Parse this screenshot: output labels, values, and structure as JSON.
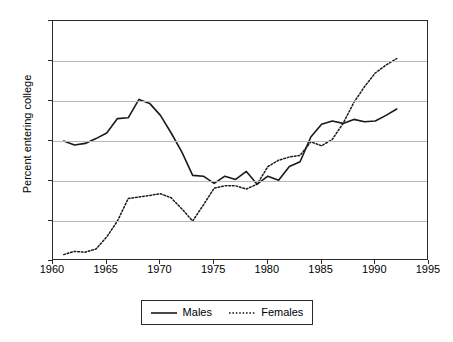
{
  "chart_data": {
    "type": "line",
    "title": "",
    "xlabel": "",
    "ylabel": "Percent entering college",
    "xlim": [
      1960,
      1995
    ],
    "ylim": [
      40,
      70
    ],
    "grid": true,
    "legend_position": "bottom",
    "x_ticks": [
      1960,
      1965,
      1970,
      1975,
      1980,
      1985,
      1990,
      1995
    ],
    "y_ticks": [
      40,
      45,
      50,
      55,
      60,
      65,
      70
    ],
    "x": [
      1961,
      1962,
      1963,
      1964,
      1965,
      1966,
      1967,
      1968,
      1969,
      1970,
      1971,
      1972,
      1973,
      1974,
      1975,
      1976,
      1977,
      1978,
      1979,
      1980,
      1981,
      1982,
      1983,
      1984,
      1985,
      1986,
      1987,
      1988,
      1989,
      1990,
      1991,
      1992
    ],
    "series": [
      {
        "name": "Males",
        "style": "solid",
        "color": "#1a1a1a",
        "values": [
          55.0,
          54.5,
          54.7,
          55.3,
          56.0,
          57.8,
          57.9,
          60.2,
          59.7,
          58.2,
          56.0,
          53.6,
          50.7,
          50.6,
          49.7,
          50.6,
          50.2,
          51.2,
          49.6,
          50.6,
          50.1,
          51.8,
          52.4,
          55.5,
          57.1,
          57.5,
          57.2,
          57.7,
          57.4,
          57.5,
          58.2,
          59.0
        ]
      },
      {
        "name": "Females",
        "style": "dotted",
        "color": "#1a1a1a",
        "values": [
          40.8,
          41.2,
          41.1,
          41.5,
          43.0,
          45.0,
          47.8,
          48.0,
          48.2,
          48.4,
          47.9,
          46.5,
          45.0,
          47.0,
          49.1,
          49.4,
          49.4,
          49.0,
          49.6,
          51.8,
          52.6,
          53.0,
          53.2,
          54.9,
          54.4,
          55.2,
          57.2,
          59.8,
          61.8,
          63.5,
          64.5,
          65.3
        ]
      }
    ]
  },
  "axes": {
    "y_title": "Percent entering college",
    "y_tick_labels": [
      "70",
      "65",
      "60",
      "55",
      "50",
      "45",
      "40"
    ],
    "x_tick_labels": [
      "1960",
      "1965",
      "1970",
      "1975",
      "1980",
      "1985",
      "1990",
      "1995"
    ]
  },
  "legend": {
    "entries": [
      {
        "label": "Males",
        "style": "solid"
      },
      {
        "label": "Females",
        "style": "dotted"
      }
    ]
  }
}
